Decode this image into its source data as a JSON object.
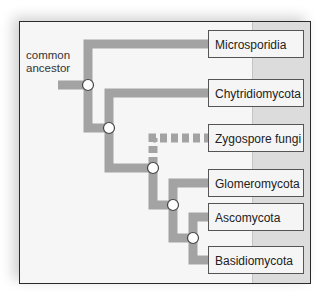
{
  "diagram": {
    "type": "phylogenetic-tree",
    "root_label": "common ancestor",
    "root_label_lines": [
      "common",
      "ancestor"
    ],
    "colors": {
      "branch": "#a3a3a3",
      "frame_bg": "#f6f6f6",
      "right_column": "#dcdcdc",
      "node_fill": "#ffffff",
      "node_stroke": "#444444"
    },
    "taxa": [
      {
        "label": "Microsporidia",
        "dashed": false
      },
      {
        "label": "Chytridiomycota",
        "dashed": false
      },
      {
        "label": "Zygospore fungi",
        "dashed": true
      },
      {
        "label": "Glomeromycota",
        "dashed": false
      },
      {
        "label": "Ascomycota",
        "dashed": false
      },
      {
        "label": "Basidiomycota",
        "dashed": false
      }
    ],
    "nodes": 5
  }
}
